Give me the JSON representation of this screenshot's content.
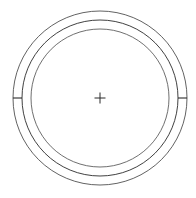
{
  "drawing": {
    "type": "technical-drawing",
    "subject": "concentric-circles-with-center-mark",
    "canvas": {
      "width": 196,
      "height": 198,
      "background": "#ffffff"
    },
    "stroke_color": "#2b2b2b",
    "center": {
      "x": 100,
      "y": 98
    },
    "circles": [
      {
        "name": "outer-circle",
        "radius": 87,
        "stroke_width": 0.8,
        "color": "#3a3a3a"
      },
      {
        "name": "middle-circle",
        "radius": 78,
        "stroke_width": 0.9,
        "color": "#2b2b2b"
      },
      {
        "name": "inner-circle",
        "radius": 69,
        "stroke_width": 0.8,
        "color": "#4a4a4a"
      }
    ],
    "ticks": [
      {
        "name": "left-tick",
        "angle_deg": 180,
        "inner_radius": 78,
        "outer_radius": 87,
        "stroke_width": 1.1
      },
      {
        "name": "right-tick",
        "angle_deg": 0,
        "inner_radius": 78,
        "outer_radius": 87,
        "stroke_width": 1.1
      }
    ],
    "center_mark": {
      "name": "center-crosshair",
      "arm_length": 5.5,
      "stroke_width": 1.0,
      "color": "#2b2b2b"
    },
    "labels": {
      "title": "",
      "dimensions": [],
      "annotations": []
    }
  }
}
